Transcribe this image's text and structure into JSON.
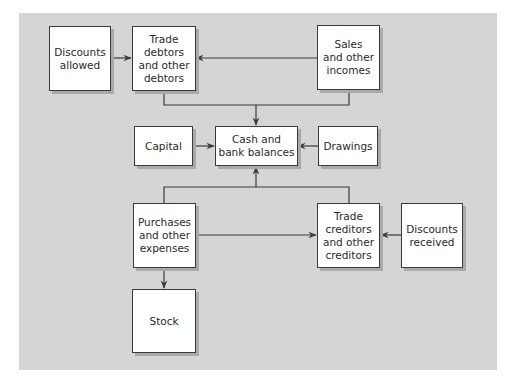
{
  "diagram": {
    "nodes": {
      "discounts_allowed": {
        "label": "Discounts\nallowed"
      },
      "trade_debtors": {
        "label": "Trade\ndebtors\nand other\ndebtors"
      },
      "sales": {
        "label": "Sales\nand other\nincomes"
      },
      "capital": {
        "label": "Capital"
      },
      "cash": {
        "label": "Cash and\nbank balances"
      },
      "drawings": {
        "label": "Drawings"
      },
      "purchases": {
        "label": "Purchases\nand other\nexpenses"
      },
      "trade_creditors": {
        "label": "Trade\ncreditors\nand other\ncreditors"
      },
      "discounts_received": {
        "label": "Discounts\nreceived"
      },
      "stock": {
        "label": "Stock"
      }
    },
    "edges": [
      {
        "from": "discounts_allowed",
        "to": "trade_debtors"
      },
      {
        "from": "sales",
        "to": "trade_debtors"
      },
      {
        "from": "trade_debtors",
        "to": "cash"
      },
      {
        "from": "sales",
        "to": "cash"
      },
      {
        "from": "capital",
        "to": "cash"
      },
      {
        "from": "drawings",
        "to": "cash"
      },
      {
        "from": "purchases",
        "to": "cash"
      },
      {
        "from": "trade_creditors",
        "to": "cash"
      },
      {
        "from": "purchases",
        "to": "trade_creditors"
      },
      {
        "from": "discounts_received",
        "to": "trade_creditors"
      },
      {
        "from": "purchases",
        "to": "stock"
      }
    ],
    "colors": {
      "panel": "#d5d5d5",
      "box": "#ffffff",
      "border": "#3a3a3a",
      "line": "#3a3a3a",
      "shadow": "#a9a9a9"
    }
  }
}
